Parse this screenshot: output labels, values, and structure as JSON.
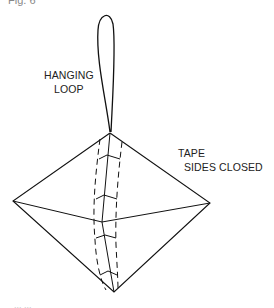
{
  "figure": {
    "label": "Fig. 6",
    "bottom_label": "... ...",
    "annotations": {
      "hanging_line1": "HANGING",
      "hanging_line2": "LOOP",
      "tape_line1": "TAPE",
      "tape_line2": "SIDES CLOSED"
    }
  }
}
